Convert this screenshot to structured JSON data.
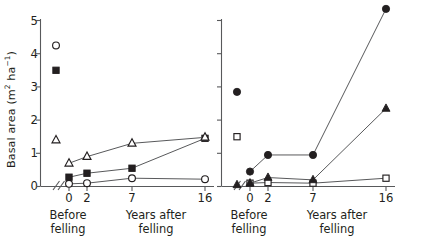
{
  "figure": {
    "width": 434,
    "height": 242,
    "background": "#ffffff",
    "ink_color": "#231f20",
    "line_color": "#58595b"
  },
  "axis": {
    "y_label_text": "Basal area (m",
    "y_label_unit_sup1": "2",
    "y_label_mid": " ha",
    "y_label_unit_sup2": "−1",
    "y_label_close": ")",
    "y_label_plain": "Basal area (m2 ha-1)",
    "y_ticks": [
      "0",
      "1",
      "2",
      "3",
      "4",
      "5"
    ],
    "y_min": 0,
    "y_max": 5,
    "x_ticks": [
      "0",
      "2",
      "7",
      "16"
    ],
    "x_caption_before": "Before\nfelling",
    "x_caption_after": "Years after\nfelling",
    "axis_break": "double-slash"
  },
  "chart_data": [
    {
      "type": "line",
      "panel": "left",
      "title": "",
      "xlabel": "Years after felling",
      "ylabel": "Basal area (m2 ha-1)",
      "ylim": [
        0,
        5
      ],
      "x": [
        0,
        2,
        7,
        16
      ],
      "x_tick_labels": [
        "0",
        "2",
        "7",
        "16"
      ],
      "before_felling_label": "Before felling",
      "grid": false,
      "legend": "none",
      "axis_break_between": [
        "Before felling",
        "0"
      ],
      "series": [
        {
          "name": "open-circle",
          "marker": "open-circle",
          "before_felling": 4.25,
          "before_felling_connected": false,
          "values": [
            0.08,
            0.1,
            0.25,
            0.22
          ]
        },
        {
          "name": "filled-square",
          "marker": "filled-square",
          "before_felling": 3.5,
          "before_felling_connected": false,
          "values": [
            0.28,
            0.4,
            0.55,
            1.45
          ]
        },
        {
          "name": "open-triangle",
          "marker": "open-triangle",
          "before_felling": 1.4,
          "before_felling_connected": false,
          "values": [
            0.7,
            0.9,
            1.3,
            1.48
          ]
        }
      ]
    },
    {
      "type": "line",
      "panel": "right",
      "title": "",
      "xlabel": "Years after felling",
      "ylabel": "",
      "ylim": [
        0,
        5
      ],
      "x": [
        0,
        2,
        7,
        16
      ],
      "x_tick_labels": [
        "0",
        "2",
        "7",
        "16"
      ],
      "before_felling_label": "Before felling",
      "grid": false,
      "legend": "none",
      "y_tick_labels_shown": false,
      "axis_break_between": [
        "Before felling",
        "0"
      ],
      "series": [
        {
          "name": "filled-circle",
          "marker": "filled-circle",
          "before_felling": 2.85,
          "before_felling_connected": false,
          "values": [
            0.45,
            0.95,
            0.95,
            5.35
          ]
        },
        {
          "name": "open-square",
          "marker": "open-square",
          "before_felling": 1.5,
          "before_felling_connected": false,
          "values": [
            0.1,
            0.12,
            0.1,
            0.25
          ]
        },
        {
          "name": "filled-triangle",
          "marker": "filled-triangle",
          "before_felling": 0.05,
          "before_felling_connected": false,
          "values": [
            0.1,
            0.27,
            0.2,
            2.35
          ]
        }
      ]
    }
  ]
}
